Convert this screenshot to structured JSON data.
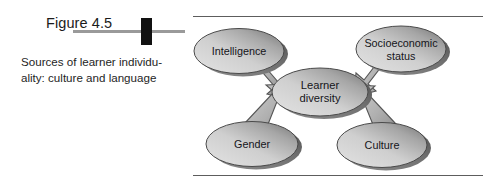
{
  "caption": {
    "figure_number": "Figure 4.5",
    "caption_line_1": "Sources of learner individu-",
    "caption_line_2": "ality: culture and language",
    "marker_icon": "black-rectangle-marker",
    "rule_icon": "horizontal-rule"
  },
  "diagram": {
    "type": "concept-map",
    "center_node": {
      "id": "learner-diversity",
      "label_line_1": "Learner",
      "label_line_2": "diversity"
    },
    "source_nodes": [
      {
        "id": "intelligence",
        "label_line_1": "Intelligence",
        "label_line_2": "",
        "position": "top-left"
      },
      {
        "id": "socioeconomic-status",
        "label_line_1": "Socioeconomic",
        "label_line_2": "status",
        "position": "top-right"
      },
      {
        "id": "gender",
        "label_line_1": "Gender",
        "label_line_2": "",
        "position": "bottom-left"
      },
      {
        "id": "culture",
        "label_line_1": "Culture",
        "label_line_2": "",
        "position": "bottom-right"
      }
    ],
    "arrows": [
      {
        "from": "intelligence",
        "to": "learner-diversity",
        "direction": "down-right"
      },
      {
        "from": "socioeconomic-status",
        "to": "learner-diversity",
        "direction": "down-left"
      },
      {
        "from": "gender",
        "to": "learner-diversity",
        "direction": "up-right"
      },
      {
        "from": "culture",
        "to": "learner-diversity",
        "direction": "up-left"
      }
    ],
    "colors": {
      "ellipse_light": "#d6d6d6",
      "ellipse_mid": "#a8a8a8",
      "ellipse_dark": "#5a5a5a",
      "ellipse_stroke": "#4a4a4a",
      "arrow_fill": "#b4b4b4",
      "arrow_stroke": "#555555",
      "frame_line": "#5d5d5d",
      "text": "#15151a",
      "marker": "#111111",
      "rule": "#9a9a9a"
    }
  }
}
